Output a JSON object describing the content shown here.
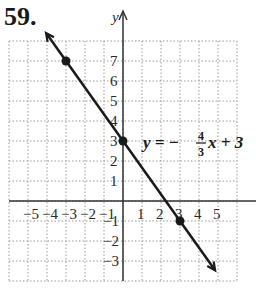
{
  "problem_number": "59.",
  "axis_label_y": "y",
  "equation": {
    "lhs": "y = −",
    "num": "4",
    "den": "3",
    "rhs": "x + 3"
  },
  "x_ticks": [
    "−5",
    "−4",
    "−3",
    "−2",
    "−1",
    "1",
    "2",
    "3",
    "4",
    "5"
  ],
  "y_ticks": [
    "7",
    "6",
    "5",
    "4",
    "3",
    "2",
    "1",
    "−1",
    "−2",
    "−3"
  ],
  "points": [
    {
      "x": -3,
      "y": 7
    },
    {
      "x": 0,
      "y": 3
    },
    {
      "x": 3,
      "y": -1
    }
  ],
  "colors": {
    "line": "#1a1a1a",
    "grid": "#9a9a9a",
    "axis": "#333333"
  }
}
